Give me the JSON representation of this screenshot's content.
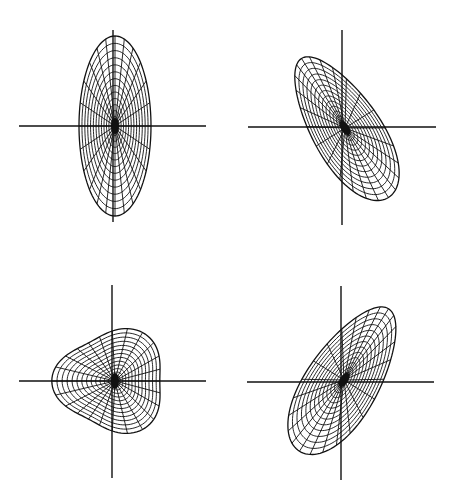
{
  "figure": {
    "ink_color": "#111111",
    "background": "#ffffff",
    "panels": [
      {
        "id": "top-left",
        "shape": "vertical ellipse",
        "axes": {
          "cx": 113,
          "cy": 126,
          "x_extent": [
            19,
            206
          ],
          "y_extent": [
            30,
            222
          ]
        },
        "center": [
          115,
          126
        ],
        "rx": 36,
        "ry": 90,
        "rotation": 0,
        "skew": 0.0,
        "rings": 14,
        "spokes": 24
      },
      {
        "id": "top-right",
        "shape": "tilted egg (upper-left to lower-right)",
        "axes": {
          "cx": 342,
          "cy": 127,
          "x_extent": [
            248,
            436
          ],
          "y_extent": [
            30,
            225
          ]
        },
        "center": [
          345,
          128
        ],
        "rx": 34,
        "ry": 82,
        "rotation": -32,
        "skew": 0.25,
        "rings": 14,
        "spokes": 24
      },
      {
        "id": "bottom-left",
        "shape": "rounded triangle",
        "axes": {
          "cx": 112,
          "cy": 381,
          "x_extent": [
            19,
            206
          ],
          "y_extent": [
            285,
            478
          ]
        },
        "center": [
          115,
          381
        ],
        "rx": 54,
        "ry": 50,
        "rotation": 0,
        "skew": 0.0,
        "rings": 14,
        "spokes": 24
      },
      {
        "id": "bottom-right",
        "shape": "tilted egg (lower-left to upper-right)",
        "axes": {
          "cx": 341,
          "cy": 382,
          "x_extent": [
            247,
            434
          ],
          "y_extent": [
            286,
            480
          ]
        },
        "center": [
          344,
          380
        ],
        "rx": 36,
        "ry": 84,
        "rotation": 32,
        "skew": 0.25,
        "rings": 14,
        "spokes": 24
      }
    ]
  }
}
